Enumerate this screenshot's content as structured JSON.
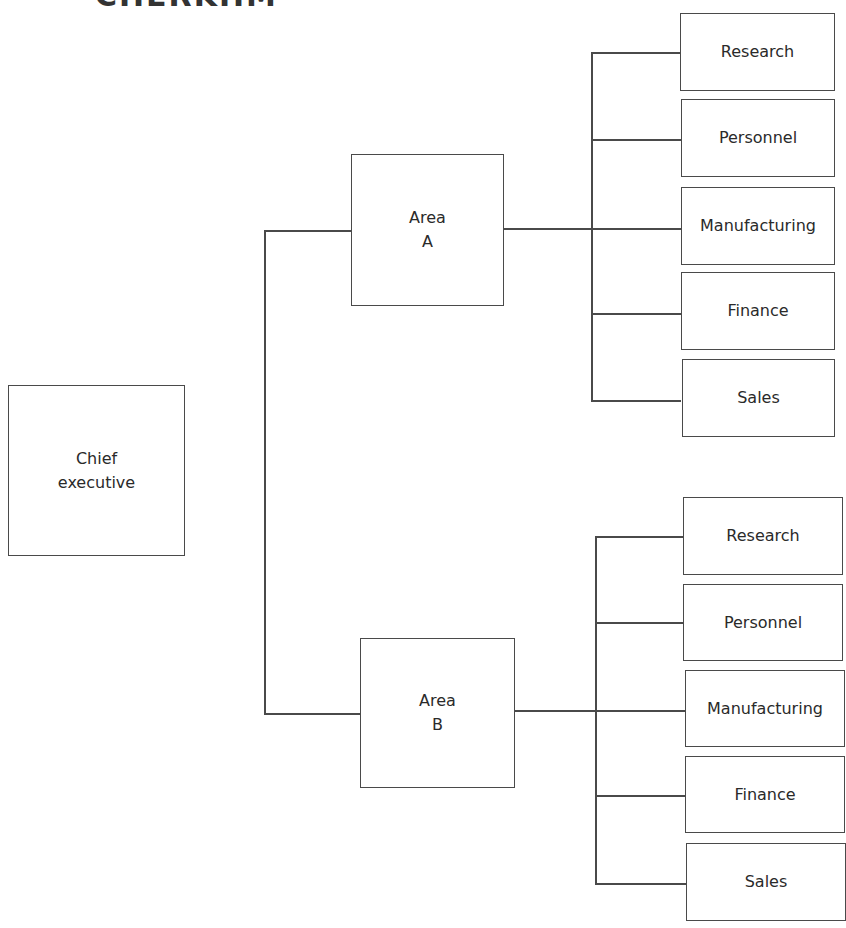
{
  "diagram": {
    "type": "organization-chart",
    "title_fragment": "CHERKHM",
    "root": {
      "line1": "Chief",
      "line2": "executive"
    },
    "areas": [
      {
        "line1": "Area",
        "line2": "A",
        "departments": [
          "Research",
          "Personnel",
          "Manufacturing",
          "Finance",
          "Sales"
        ]
      },
      {
        "line1": "Area",
        "line2": "B",
        "departments": [
          "Research",
          "Personnel",
          "Manufacturing",
          "Finance",
          "Sales"
        ]
      }
    ],
    "colors": {
      "line": "#4a4a4a",
      "text": "#2a2a2a",
      "background": "#ffffff"
    }
  }
}
